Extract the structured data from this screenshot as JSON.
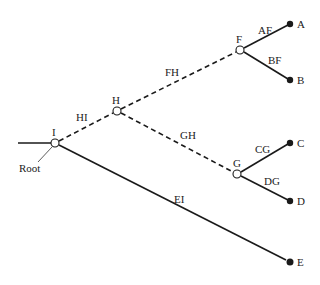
{
  "diagram": {
    "type": "phylogenetic-tree",
    "root_label": "Root",
    "nodes": [
      {
        "id": "I",
        "label": "I",
        "x": 55,
        "y": 143,
        "kind": "internal"
      },
      {
        "id": "H",
        "label": "H",
        "x": 117,
        "y": 111,
        "kind": "internal"
      },
      {
        "id": "F",
        "label": "F",
        "x": 240,
        "y": 50,
        "kind": "internal"
      },
      {
        "id": "G",
        "label": "G",
        "x": 237,
        "y": 174,
        "kind": "internal"
      },
      {
        "id": "A",
        "label": "A",
        "x": 290,
        "y": 24,
        "kind": "leaf"
      },
      {
        "id": "B",
        "label": "B",
        "x": 290,
        "y": 80,
        "kind": "leaf"
      },
      {
        "id": "C",
        "label": "C",
        "x": 290,
        "y": 143,
        "kind": "leaf"
      },
      {
        "id": "D",
        "label": "D",
        "x": 290,
        "y": 201,
        "kind": "leaf"
      },
      {
        "id": "E",
        "label": "E",
        "x": 290,
        "y": 262,
        "kind": "leaf"
      }
    ],
    "edges": [
      {
        "label": "HI",
        "from": "I",
        "to": "H",
        "style": "dashed"
      },
      {
        "label": "FH",
        "from": "H",
        "to": "F",
        "style": "dashed"
      },
      {
        "label": "GH",
        "from": "H",
        "to": "G",
        "style": "dashed"
      },
      {
        "label": "AF",
        "from": "F",
        "to": "A",
        "style": "solid"
      },
      {
        "label": "BF",
        "from": "F",
        "to": "B",
        "style": "solid"
      },
      {
        "label": "CG",
        "from": "G",
        "to": "C",
        "style": "solid"
      },
      {
        "label": "DG",
        "from": "G",
        "to": "D",
        "style": "solid"
      },
      {
        "label": "EI",
        "from": "I",
        "to": "E",
        "style": "solid"
      }
    ]
  }
}
